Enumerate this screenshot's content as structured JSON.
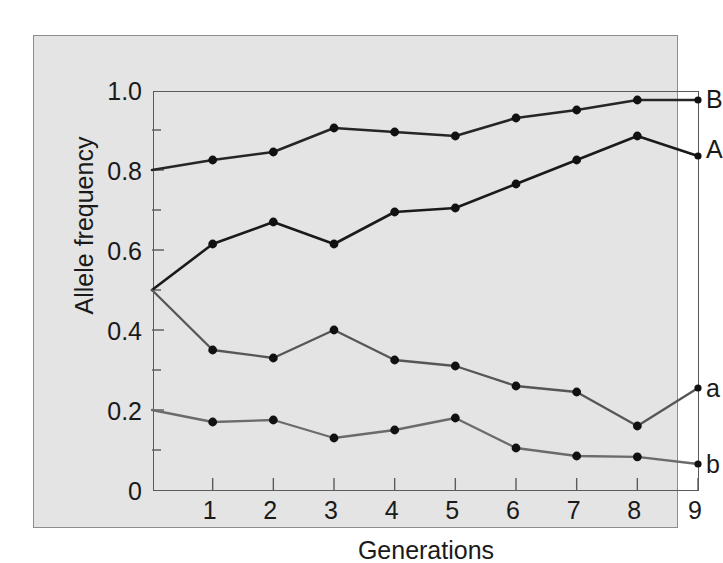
{
  "chart_data": {
    "type": "line",
    "title": "",
    "xlabel": "Generations",
    "ylabel": "Allele frequency",
    "x": [
      0,
      1,
      2,
      3,
      4,
      5,
      6,
      7,
      8,
      9
    ],
    "xlim": [
      0,
      9
    ],
    "ylim": [
      0,
      1.0
    ],
    "grid": false,
    "legend_position": "right-inline-labels",
    "x_tick_labels": [
      "1",
      "2",
      "3",
      "4",
      "5",
      "6",
      "7",
      "8",
      "9"
    ],
    "x_tick_values": [
      1,
      2,
      3,
      4,
      5,
      6,
      7,
      8,
      9
    ],
    "y_tick_labels": [
      "0",
      "0.2",
      "0.4",
      "0.6",
      "0.8",
      "1.0"
    ],
    "y_tick_values": [
      0,
      0.2,
      0.4,
      0.6,
      0.8,
      1.0
    ],
    "y_minor_tick_values": [
      0.1,
      0.3,
      0.5,
      0.7,
      0.9
    ],
    "series": [
      {
        "name": "B",
        "label": "B",
        "color": "#262626",
        "values": [
          0.8,
          0.825,
          0.845,
          0.905,
          0.895,
          0.885,
          0.93,
          0.95,
          0.975,
          0.975
        ]
      },
      {
        "name": "A",
        "label": "A",
        "color": "#1a1a1a",
        "values": [
          0.5,
          0.615,
          0.67,
          0.615,
          0.695,
          0.705,
          0.765,
          0.825,
          0.885,
          0.835
        ]
      },
      {
        "name": "a",
        "label": "a",
        "color": "#565656",
        "values": [
          0.5,
          0.35,
          0.33,
          0.4,
          0.325,
          0.31,
          0.26,
          0.245,
          0.16,
          0.255
        ]
      },
      {
        "name": "b",
        "label": "b",
        "color": "#6b6b6b",
        "values": [
          0.2,
          0.17,
          0.175,
          0.13,
          0.15,
          0.18,
          0.105,
          0.085,
          0.083,
          0.065
        ]
      }
    ]
  },
  "colors": {
    "figure_background": "#e4e4e4",
    "page_background": "#ffffff",
    "axis_line": "#5a5a5a",
    "outer_border": "#8d8d8d",
    "text": "#1a1a1a"
  }
}
